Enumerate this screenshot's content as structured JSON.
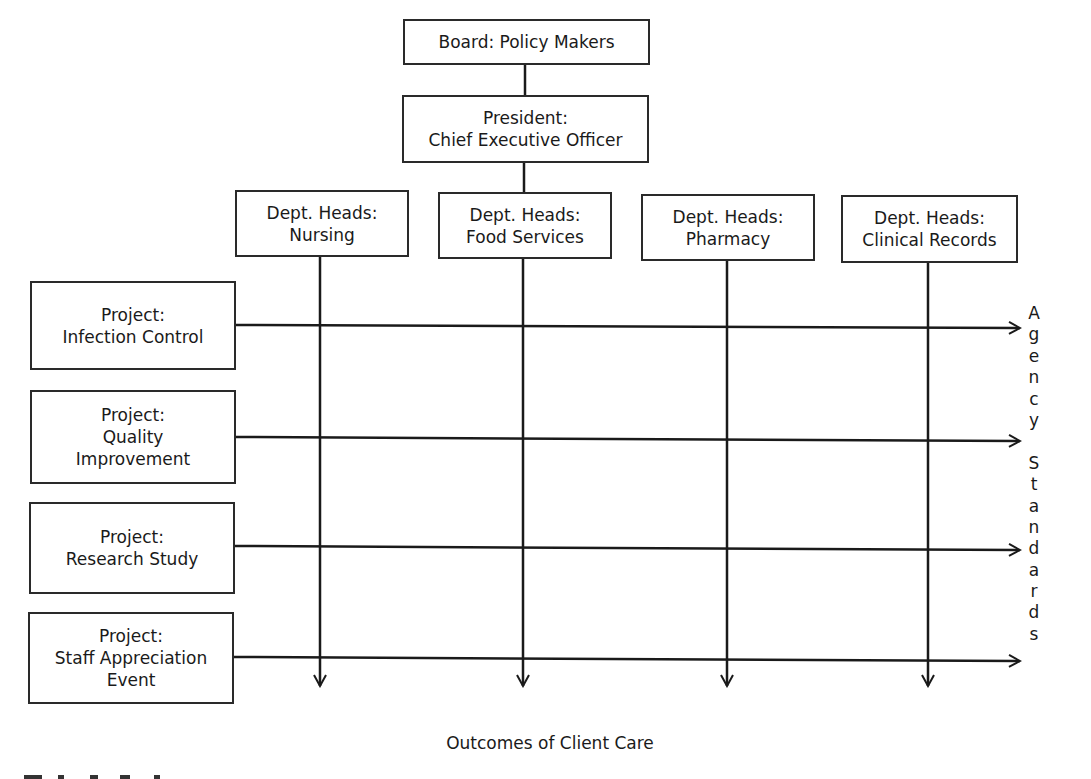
{
  "diagram": {
    "type": "matrix-organization-chart",
    "top": [
      {
        "id": "board",
        "lines": [
          "Board: Policy Makers"
        ]
      },
      {
        "id": "president",
        "lines": [
          "President:",
          "Chief Executive Officer"
        ]
      }
    ],
    "departments": [
      {
        "id": "nursing",
        "lines": [
          "Dept. Heads:",
          "Nursing"
        ]
      },
      {
        "id": "food-services",
        "lines": [
          "Dept. Heads:",
          "Food Services"
        ]
      },
      {
        "id": "pharmacy",
        "lines": [
          "Dept. Heads:",
          "Pharmacy"
        ]
      },
      {
        "id": "clinical-records",
        "lines": [
          "Dept. Heads:",
          "Clinical Records"
        ]
      }
    ],
    "projects": [
      {
        "id": "infection-control",
        "lines": [
          "Project:",
          "Infection Control"
        ]
      },
      {
        "id": "quality-improvement",
        "lines": [
          "Project:",
          "Quality",
          "Improvement"
        ]
      },
      {
        "id": "research-study",
        "lines": [
          "Project:",
          "Research Study"
        ]
      },
      {
        "id": "staff-appreciation",
        "lines": [
          "Project:",
          "Staff Appreciation",
          "Event"
        ]
      }
    ],
    "right_label": {
      "text": "Agency Standards",
      "letters": [
        "A",
        "g",
        "e",
        "n",
        "c",
        "y",
        "",
        "S",
        "t",
        "a",
        "n",
        "d",
        "a",
        "r",
        "d",
        "s"
      ]
    },
    "bottom_label": "Outcomes of Client Care",
    "colors": {
      "line": "#1a1a1a",
      "box_border": "#2a2a2a",
      "background": "#ffffff"
    }
  }
}
